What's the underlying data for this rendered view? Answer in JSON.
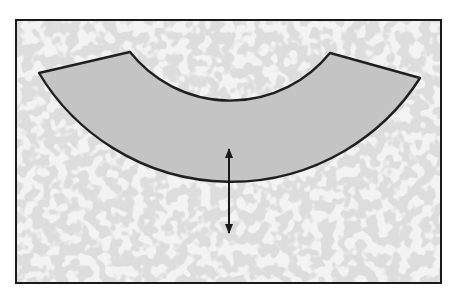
{
  "diagram": {
    "type": "annular-sector-with-width-arrow",
    "colors": {
      "background": "#ffffff",
      "texture_base": "#f2f2f2",
      "texture_spots": "#c8c8c8",
      "shape_fill": "#c4c4c4",
      "outline": "#1a1a1a"
    },
    "frame": {
      "x": 16,
      "y": 20,
      "width": 425,
      "height": 263
    },
    "shape": {
      "outer_left": [
        39,
        73
      ],
      "inner_left": [
        130,
        52
      ],
      "inner_right": [
        330,
        53
      ],
      "outer_right": [
        420,
        78
      ],
      "inner_arc_bottom": [
        229,
        145
      ],
      "outer_arc_bottom": [
        229,
        235
      ]
    },
    "arrow": {
      "x": 229,
      "y1": 148,
      "y2": 233,
      "style": "double-headed"
    }
  }
}
